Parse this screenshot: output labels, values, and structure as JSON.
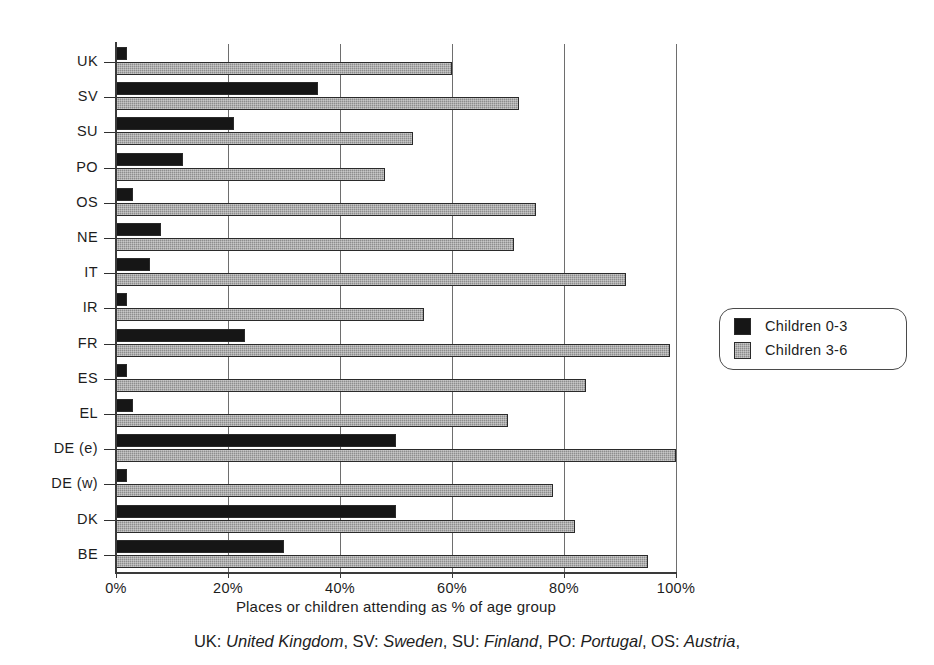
{
  "chart_data": {
    "type": "bar",
    "orientation": "horizontal",
    "title": "",
    "xlabel": "Places or children attending as % of age group",
    "ylabel": "",
    "xlim": [
      0,
      100
    ],
    "xticks": [
      "0%",
      "20%",
      "40%",
      "60%",
      "80%",
      "100%"
    ],
    "xtick_values": [
      0,
      20,
      40,
      60,
      80,
      100
    ],
    "grid": "vertical",
    "legend_position": "right",
    "categories": [
      "UK",
      "SV",
      "SU",
      "PO",
      "OS",
      "NE",
      "IT",
      "IR",
      "FR",
      "ES",
      "EL",
      "DE (e)",
      "DE (w)",
      "DK",
      "BE"
    ],
    "series": [
      {
        "name": "Children 0-3",
        "color": "#161616",
        "values": [
          2,
          36,
          21,
          12,
          3,
          8,
          6,
          2,
          23,
          2,
          3,
          50,
          2,
          50,
          30
        ]
      },
      {
        "name": "Children 3-6",
        "color": "#8d8d8d",
        "values": [
          60,
          72,
          53,
          48,
          75,
          71,
          91,
          55,
          99,
          84,
          70,
          100,
          78,
          82,
          95
        ]
      }
    ]
  },
  "legend": {
    "items": [
      {
        "label": "Children 0-3"
      },
      {
        "label": "Children 3-6"
      }
    ]
  },
  "caption": {
    "text": "UK: United Kingdom, SV: Sweden, SU: Finland, PO: Portugal, OS: Austria,",
    "parts": [
      {
        "text": "UK: ",
        "italic": false
      },
      {
        "text": "United Kingdom",
        "italic": true
      },
      {
        "text": ", SV: ",
        "italic": false
      },
      {
        "text": "Sweden",
        "italic": true
      },
      {
        "text": ", SU: ",
        "italic": false
      },
      {
        "text": "Finland",
        "italic": true
      },
      {
        "text": ", PO: ",
        "italic": false
      },
      {
        "text": "Portugal",
        "italic": true
      },
      {
        "text": ", OS: ",
        "italic": false
      },
      {
        "text": "Austria",
        "italic": true
      },
      {
        "text": ",",
        "italic": false
      }
    ]
  }
}
